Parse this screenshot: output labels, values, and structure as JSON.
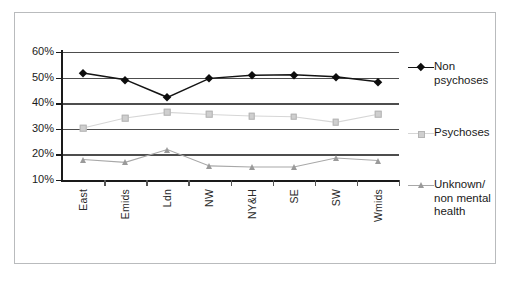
{
  "chart_data": {
    "type": "line",
    "title": "",
    "subtitle": "",
    "xlabel": "",
    "ylabel": "",
    "categories": [
      "East",
      "Emids",
      "Ldn",
      "NW",
      "NY&H",
      "SE",
      "SW",
      "Wmids"
    ],
    "ytick_labels": [
      "60%",
      "50%",
      "40%",
      "30%",
      "20%",
      "10%"
    ],
    "ytick_values": [
      60,
      50,
      40,
      30,
      20,
      10
    ],
    "ylim": [
      10,
      60
    ],
    "grid": true,
    "legend_position": "right",
    "series": [
      {
        "name": "Non psychoses",
        "legend_label": "Non\npsychoses",
        "marker": "diamond",
        "color": "#0d0d0d",
        "values": [
          51.8,
          49.2,
          42.3,
          49.7,
          50.9,
          51.1,
          50.3,
          48.4
        ]
      },
      {
        "name": "Psychoses",
        "legend_label": "Psychoses",
        "marker": "square",
        "color": "#cfcfcf",
        "values": [
          30.3,
          34.2,
          36.4,
          35.6,
          35.0,
          34.7,
          32.5,
          35.7
        ]
      },
      {
        "name": "Unknown/ non mental health",
        "legend_label": "Unknown/\nnon mental\nhealth",
        "marker": "triangle",
        "color": "#9a9a9a",
        "values": [
          18.0,
          16.9,
          21.9,
          15.5,
          15.1,
          15.1,
          18.6,
          17.6
        ]
      }
    ]
  },
  "colors": {
    "frame_border": "#b9bbbd",
    "axis": "#1a1a1a",
    "gridline": "#4d4d4d",
    "series_non_psychoses": "#0d0d0d",
    "series_psychoses": "#cfcfcf",
    "series_unknown": "#9a9a9a",
    "background": "#ffffff"
  }
}
